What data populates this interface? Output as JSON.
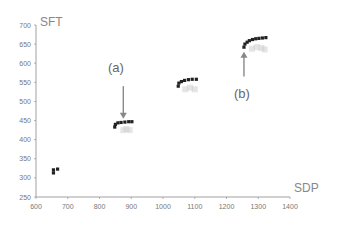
{
  "chart_data": {
    "type": "scatter",
    "title": "",
    "xlabel": "SDP",
    "ylabel": "SFT",
    "xlim": [
      600,
      1400
    ],
    "ylim": [
      250,
      700
    ],
    "xticks": [
      600,
      700,
      800,
      900,
      1000,
      1100,
      1200,
      1300,
      1400
    ],
    "yticks": [
      250,
      300,
      350,
      400,
      450,
      500,
      550,
      600,
      650,
      700
    ],
    "grid": false,
    "legend": null,
    "series": [
      {
        "name": "clusters",
        "color": "#222222",
        "marker": "square",
        "points": [
          {
            "x": 655,
            "y": 313
          },
          {
            "x": 655,
            "y": 321
          },
          {
            "x": 668,
            "y": 323
          },
          {
            "x": 848,
            "y": 433
          },
          {
            "x": 850,
            "y": 440
          },
          {
            "x": 858,
            "y": 444
          },
          {
            "x": 868,
            "y": 445
          },
          {
            "x": 880,
            "y": 446
          },
          {
            "x": 892,
            "y": 447
          },
          {
            "x": 902,
            "y": 447
          },
          {
            "x": 1048,
            "y": 540
          },
          {
            "x": 1050,
            "y": 548
          },
          {
            "x": 1058,
            "y": 552
          },
          {
            "x": 1068,
            "y": 555
          },
          {
            "x": 1080,
            "y": 557
          },
          {
            "x": 1092,
            "y": 558
          },
          {
            "x": 1105,
            "y": 558
          },
          {
            "x": 1255,
            "y": 642
          },
          {
            "x": 1258,
            "y": 650
          },
          {
            "x": 1265,
            "y": 655
          },
          {
            "x": 1272,
            "y": 659
          },
          {
            "x": 1282,
            "y": 662
          },
          {
            "x": 1292,
            "y": 664
          },
          {
            "x": 1302,
            "y": 665
          },
          {
            "x": 1313,
            "y": 666
          },
          {
            "x": 1324,
            "y": 667
          }
        ]
      },
      {
        "name": "faint-shadow",
        "color": "#cccccc",
        "marker": "square",
        "points": [
          {
            "x": 875,
            "y": 425
          },
          {
            "x": 885,
            "y": 428
          },
          {
            "x": 895,
            "y": 425
          },
          {
            "x": 1070,
            "y": 532
          },
          {
            "x": 1085,
            "y": 536
          },
          {
            "x": 1100,
            "y": 532
          },
          {
            "x": 1280,
            "y": 638
          },
          {
            "x": 1295,
            "y": 642
          },
          {
            "x": 1310,
            "y": 640
          },
          {
            "x": 1320,
            "y": 636
          }
        ]
      }
    ],
    "annotations": [
      {
        "label": "(a)",
        "arrow_to": {
          "x": 875,
          "y": 455
        },
        "arrow_from": {
          "x": 875,
          "y": 540
        }
      },
      {
        "label": "(b)",
        "arrow_to": {
          "x": 1255,
          "y": 630
        },
        "arrow_from": {
          "x": 1255,
          "y": 565
        }
      }
    ]
  },
  "axes": {
    "x_title": "SDP",
    "y_title": "SFT",
    "x_tick_labels": [
      "600",
      "700",
      "800",
      "900",
      "1000",
      "1100",
      "1200",
      "1300",
      "1400"
    ],
    "y_tick_labels": [
      "250",
      "300",
      "350",
      "400",
      "450",
      "500",
      "550",
      "600",
      "650",
      "700"
    ]
  },
  "annotations": {
    "a_label": "(a)",
    "b_label": "(b)"
  },
  "colors": {
    "axis": "#888888",
    "marker": "#222222",
    "shadow": "#cccccc",
    "arrow": "#888888"
  }
}
